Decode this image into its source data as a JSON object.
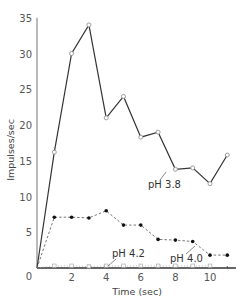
{
  "chart_data": {
    "type": "line",
    "title": "",
    "xlabel": "Time (sec)",
    "ylabel": "Impulses/sec",
    "xlim": [
      0,
      11.5
    ],
    "ylim": [
      0,
      35
    ],
    "x_ticks": [
      0,
      2,
      4,
      6,
      8,
      10
    ],
    "y_ticks": [
      5,
      10,
      15,
      20,
      25,
      30,
      35
    ],
    "y_tick_labels": [
      "5",
      "10",
      "15",
      "20",
      "25",
      "30",
      "35"
    ],
    "x_tick_labels": [
      "0",
      "2",
      "4",
      "6",
      "8",
      "10"
    ],
    "grid": false,
    "legend": "inline annotations",
    "series": [
      {
        "name": "pH 3.8",
        "style": "solid",
        "marker": "open-circle",
        "x": [
          0,
          1,
          2,
          3,
          4,
          5,
          6,
          7,
          8,
          9,
          10,
          11
        ],
        "values": [
          0,
          16.2,
          30,
          34,
          21,
          24,
          18.3,
          19,
          13.8,
          14,
          11.8,
          15.8
        ]
      },
      {
        "name": "pH 4.0",
        "style": "dashed",
        "marker": "filled-circle",
        "x": [
          0,
          1,
          2,
          3,
          4,
          5,
          6,
          7,
          8,
          9,
          10,
          11
        ],
        "values": [
          0,
          7.1,
          7.1,
          7,
          8,
          6,
          6,
          4,
          3.9,
          3.7,
          1.8,
          1.8
        ]
      },
      {
        "name": "pH 4.2",
        "style": "dotted",
        "marker": "open-square",
        "x": [
          0,
          1,
          2,
          3,
          4,
          5,
          6,
          7,
          8,
          9,
          10
        ],
        "values": [
          0,
          0.3,
          0.3,
          0.2,
          0.3,
          0.3,
          0.3,
          0.3,
          0.3,
          0.3,
          0.3
        ]
      }
    ],
    "annotations": [
      {
        "text": "pH 3.8",
        "series": "pH 3.8"
      },
      {
        "text": "pH 4.0",
        "series": "pH 4.0"
      },
      {
        "text": "pH 4.2",
        "series": "pH 4.2"
      }
    ]
  }
}
